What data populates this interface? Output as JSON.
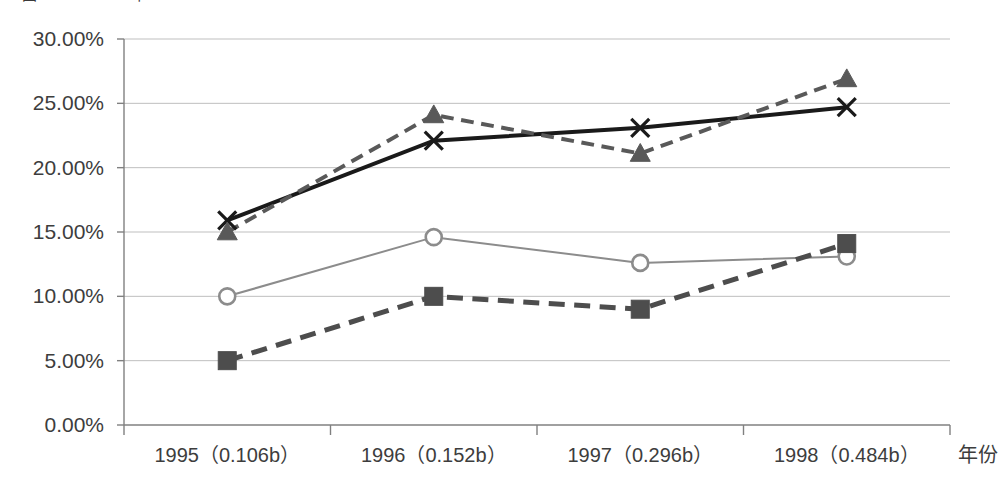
{
  "chart_data": {
    "type": "line",
    "title": "",
    "xlabel": "年份",
    "ylabel": "",
    "ylim": [
      0,
      30
    ],
    "ytick_labels": [
      "0.00%",
      "5.00%",
      "10.00%",
      "15.00%",
      "20.00%",
      "25.00%",
      "30.00%"
    ],
    "ytick_values": [
      0,
      5,
      10,
      15,
      20,
      25,
      30
    ],
    "grid": true,
    "legend_position": "none",
    "categories": [
      "1995（0.106b）",
      "1996（0.152b）",
      "1997（0.296b）",
      "1998（0.484b）"
    ],
    "series": [
      {
        "name": "series-x-cross",
        "marker": "x-cross",
        "line_style": "solid",
        "color": "#1a1a1a",
        "line_width": 4,
        "values": [
          15.9,
          22.1,
          23.1,
          24.7
        ]
      },
      {
        "name": "series-triangle",
        "marker": "triangle",
        "line_style": "dashed",
        "color": "#595959",
        "line_width": 4,
        "values": [
          15.0,
          24.1,
          21.1,
          26.9
        ]
      },
      {
        "name": "series-circle",
        "marker": "circle-open",
        "line_style": "solid",
        "color": "#8c8c8c",
        "line_width": 2,
        "values": [
          10.0,
          14.6,
          12.6,
          13.1
        ]
      },
      {
        "name": "series-square",
        "marker": "square",
        "line_style": "dashed",
        "color": "#4d4d4d",
        "line_width": 5,
        "values": [
          5.0,
          10.0,
          9.0,
          14.1
        ]
      }
    ],
    "axis_colors": {
      "grid": "#bfbfbf",
      "axis": "#808080",
      "tick_text": "#3d3d3d"
    }
  },
  "title_sliver": {
    "text": "图2 1995—1998年"
  }
}
